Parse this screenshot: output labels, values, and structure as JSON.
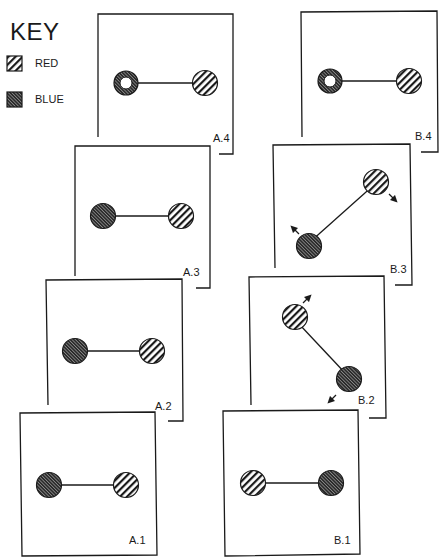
{
  "key": {
    "title": "KEY",
    "items": [
      {
        "label": "RED",
        "pattern": "wide-diagonal-stripes"
      },
      {
        "label": "BLUE",
        "pattern": "dense-dark-diagonal-hatch"
      }
    ]
  },
  "colors": {
    "line": "#1a1a1a",
    "blue_fill": "#3a3a3a",
    "red_stripe": "#1a1a1a",
    "background": "#ffffff"
  },
  "panels": [
    {
      "id": "A.4",
      "label": "A.4",
      "blue": "ring",
      "red": "solid",
      "motion": "none"
    },
    {
      "id": "A.3",
      "label": "A.3",
      "blue": "solid",
      "red": "solid",
      "motion": "none"
    },
    {
      "id": "A.2",
      "label": "A.2",
      "blue": "solid",
      "red": "solid",
      "motion": "none"
    },
    {
      "id": "A.1",
      "label": "A.1",
      "blue": "solid",
      "red": "solid",
      "motion": "none"
    },
    {
      "id": "B.4",
      "label": "B.4",
      "blue": "ring",
      "red": "solid",
      "motion": "none"
    },
    {
      "id": "B.3",
      "label": "B.3",
      "blue": "solid",
      "red": "solid",
      "motion": "stretching-apart-diagonal"
    },
    {
      "id": "B.2",
      "label": "B.2",
      "blue": "solid",
      "red": "solid",
      "motion": "stretching-apart-diagonal"
    },
    {
      "id": "B.1",
      "label": "B.1",
      "blue": "solid",
      "red": "solid",
      "motion": "none"
    }
  ]
}
